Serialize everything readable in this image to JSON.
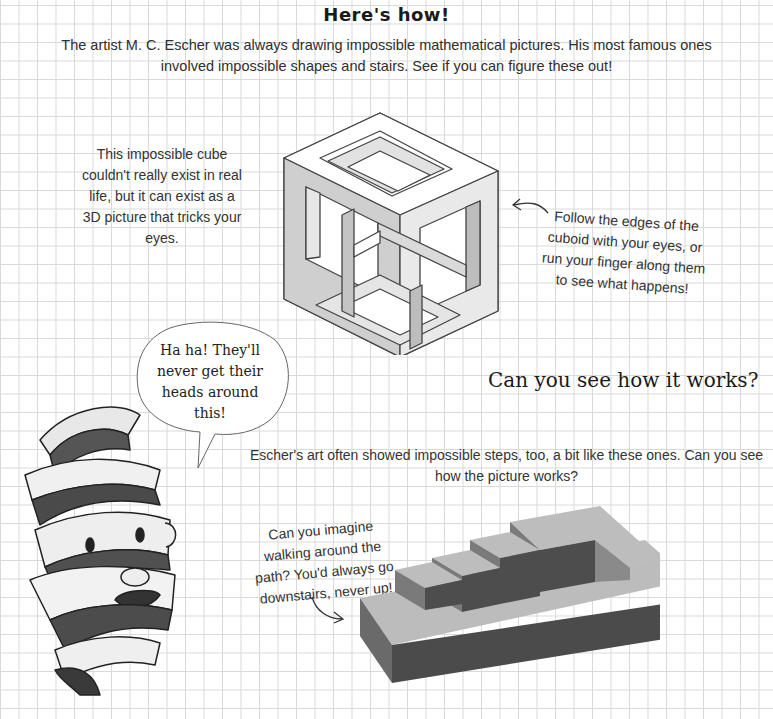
{
  "page": {
    "title": "Here's how!",
    "intro": "The artist M. C. Escher was always drawing impossible mathematical pictures. His most famous ones involved impossible shapes and stairs. See if you can figure these out!",
    "cube_note": "This impossible cube couldn't really exist in real life, but it can exist as a 3D picture that tricks your eyes.",
    "follow_note": "Follow the edges of the cuboid with your eyes, or run your finger along them to see what happens!",
    "heading2": "Can you see how it works?",
    "speech_bubble": "Ha ha! They'll never get their heads around this!",
    "escher_steps": "Escher's art often showed impossible steps, too, a bit like these ones. Can you see how the picture works?",
    "walk_note": "Can you imagine walking around the path? You'd always go downstairs, never up!"
  },
  "illustrations": {
    "cube": "impossible-cube-drawing",
    "stairs": "impossible-staircase-drawing",
    "character": "ribbon-face-character"
  },
  "colors": {
    "grid_line": "#d9d9d9",
    "text": "#333333",
    "stair_top": "#b9b9b9",
    "stair_side": "#4a4a4a",
    "cube_shade": "#c8c8c8"
  }
}
